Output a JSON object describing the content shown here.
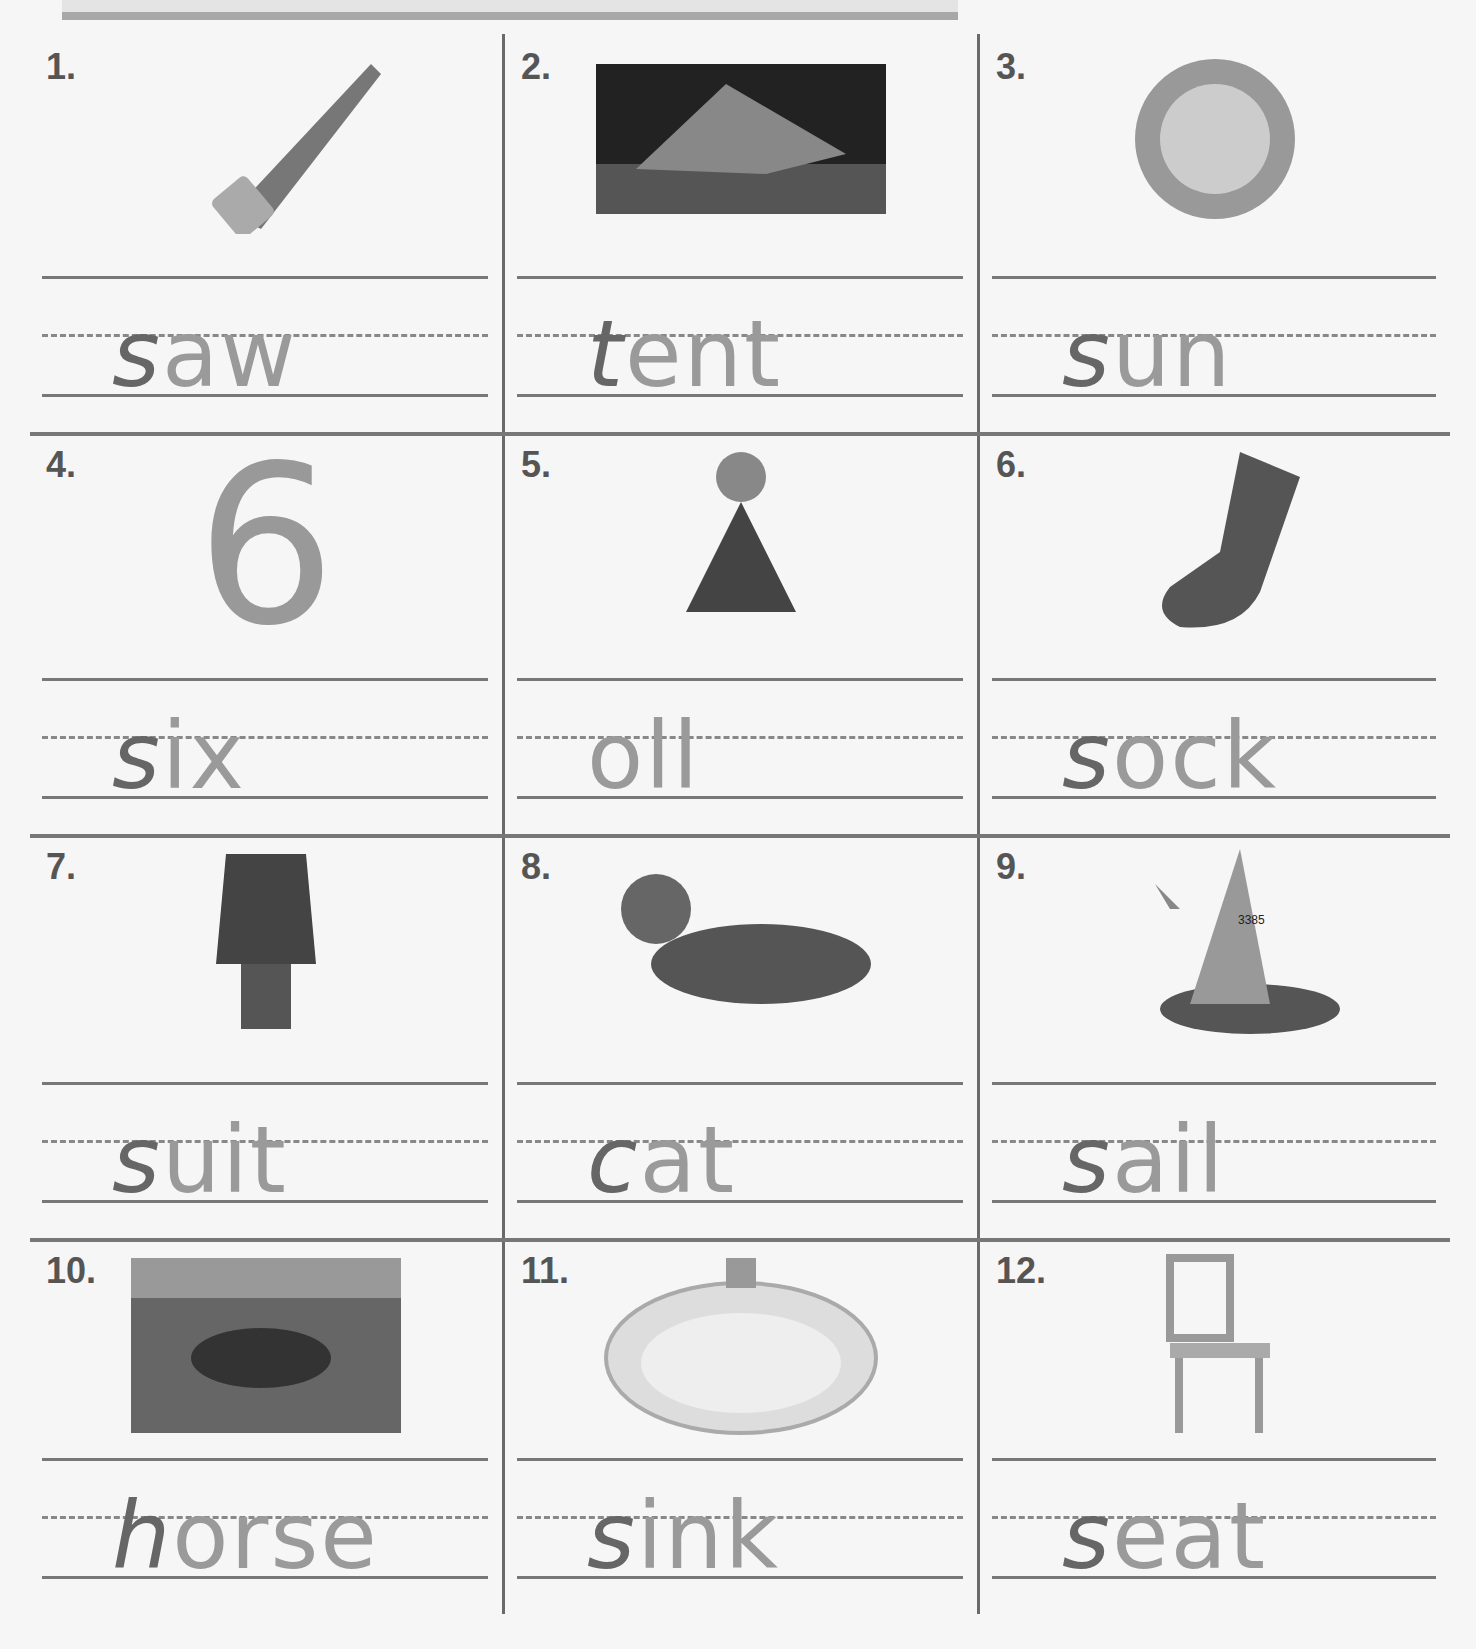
{
  "worksheet": {
    "items": [
      {
        "number": "1.",
        "picture": "saw",
        "hand": "s",
        "printed": "aw",
        "word": "saw"
      },
      {
        "number": "2.",
        "picture": "tent",
        "hand": "t",
        "printed": "ent",
        "word": "tent"
      },
      {
        "number": "3.",
        "picture": "sun",
        "hand": "s",
        "printed": "un",
        "word": "sun"
      },
      {
        "number": "4.",
        "picture": "six (number 6)",
        "hand": "s",
        "printed": "ix",
        "word": "six"
      },
      {
        "number": "5.",
        "picture": "doll",
        "hand": "",
        "printed": "oll",
        "word": "doll"
      },
      {
        "number": "6.",
        "picture": "sock",
        "hand": "s",
        "printed": "ock",
        "word": "sock"
      },
      {
        "number": "7.",
        "picture": "suit",
        "hand": "s",
        "printed": "uit",
        "word": "suit"
      },
      {
        "number": "8.",
        "picture": "cat",
        "hand": "c",
        "printed": "at",
        "word": "cat"
      },
      {
        "number": "9.",
        "picture": "sail (sailboat, 3385)",
        "hand": "s",
        "printed": "ail",
        "word": "sail"
      },
      {
        "number": "10.",
        "picture": "horse",
        "hand": "h",
        "printed": "orse",
        "word": "horse"
      },
      {
        "number": "11.",
        "picture": "sink",
        "hand": "s",
        "printed": "ink",
        "word": "sink"
      },
      {
        "number": "12.",
        "picture": "seat (chair)",
        "hand": "s",
        "printed": "eat",
        "word": "seat"
      }
    ],
    "sail_number": "3385"
  }
}
